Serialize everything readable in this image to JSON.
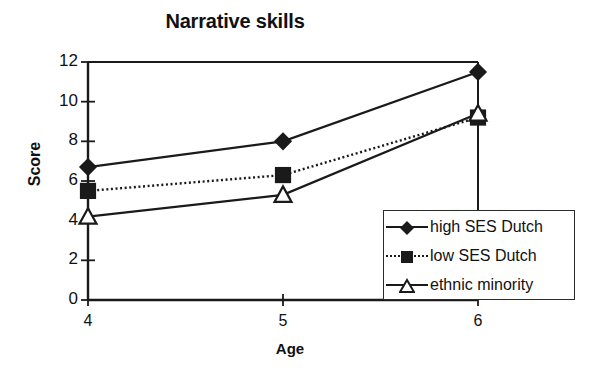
{
  "chart_data": {
    "type": "line",
    "title": "Narrative skills",
    "xlabel": "Age",
    "ylabel": "Score",
    "categories": [
      "4",
      "5",
      "6"
    ],
    "x": [
      4,
      5,
      6
    ],
    "xlim": [
      4,
      6
    ],
    "ylim": [
      0,
      12
    ],
    "yticks": [
      0,
      2,
      4,
      6,
      8,
      10,
      12
    ],
    "xticks": [
      4,
      5,
      6
    ],
    "grid": false,
    "legend_position": "inside-bottom-right",
    "series": [
      {
        "name": "high SES Dutch",
        "marker": "filled-diamond",
        "line_style": "solid",
        "values": [
          6.7,
          8.0,
          11.5
        ]
      },
      {
        "name": "low SES Dutch",
        "marker": "filled-square",
        "line_style": "dotted",
        "values": [
          5.5,
          6.3,
          9.2
        ]
      },
      {
        "name": "ethnic minority",
        "marker": "open-triangle",
        "line_style": "solid",
        "values": [
          4.2,
          5.3,
          9.4
        ]
      }
    ]
  },
  "axis": {
    "ytick_labels": [
      "12",
      "10",
      "8",
      "6",
      "4",
      "2",
      "0"
    ],
    "xtick_labels": [
      "4",
      "5",
      "6"
    ]
  },
  "legend": {
    "entries": [
      {
        "label": "high SES Dutch"
      },
      {
        "label": "low SES Dutch"
      },
      {
        "label": "ethnic minority"
      }
    ]
  },
  "colors": {
    "ink": "#1a1a1a",
    "background": "#ffffff"
  }
}
